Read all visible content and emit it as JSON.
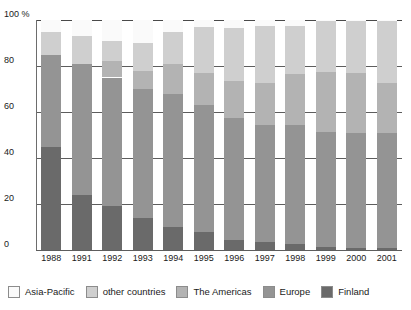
{
  "chart_data": {
    "type": "bar",
    "subtype": "stacked-100-percent",
    "title": "",
    "xlabel": "",
    "ylabel": "",
    "ylim": [
      0,
      100
    ],
    "yticks": [
      0,
      20,
      40,
      60,
      80,
      100
    ],
    "ytick_labels": [
      "0",
      "20",
      "40",
      "60",
      "80",
      "100 %"
    ],
    "unit": "%",
    "grid": true,
    "legend_position": "bottom",
    "categories": [
      "1988",
      "1991",
      "1992",
      "1993",
      "1994",
      "1995",
      "1996",
      "1997",
      "1998",
      "1999",
      "2000",
      "2001"
    ],
    "series": [
      {
        "name": "Finland",
        "color": "#6a6a6a",
        "values": [
          45,
          24,
          19,
          14,
          10,
          8,
          4.5,
          3.5,
          2.5,
          1.5,
          0.8,
          0.8
        ]
      },
      {
        "name": "Europe",
        "color": "#949494",
        "values": [
          40,
          57,
          56,
          56,
          58,
          55,
          53,
          51,
          52,
          50,
          50,
          50
        ]
      },
      {
        "name": "The Americas",
        "color": "#b3b3b3",
        "values": [
          0,
          0,
          7,
          8,
          13,
          14,
          16,
          18,
          22,
          26,
          26,
          22
        ]
      },
      {
        "name": "other countries",
        "color": "#cfcfcf",
        "values": [
          10,
          12,
          9,
          12,
          14,
          20,
          23,
          25,
          21,
          22,
          23,
          27
        ]
      },
      {
        "name": "Asia-Pacific",
        "color": "#fafafa",
        "values": [
          5,
          7,
          9,
          10,
          5,
          3,
          3.5,
          2.5,
          2.5,
          0.5,
          0.2,
          0.2
        ]
      }
    ],
    "legend": [
      {
        "label": "Asia-Pacific",
        "color": "#fafafa"
      },
      {
        "label": "other countries",
        "color": "#cfcfcf"
      },
      {
        "label": "The Americas",
        "color": "#b3b3b3"
      },
      {
        "label": "Europe",
        "color": "#949494"
      },
      {
        "label": "Finland",
        "color": "#6a6a6a"
      }
    ]
  }
}
